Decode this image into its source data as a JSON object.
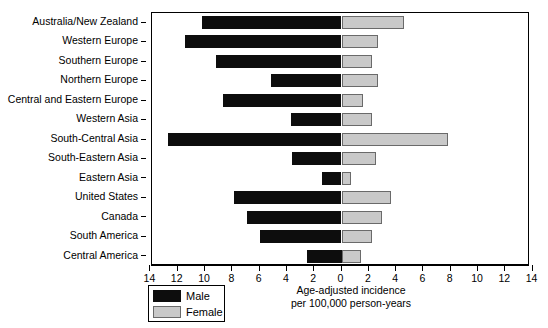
{
  "chart_data": {
    "type": "bar",
    "orientation": "horizontal-diverging",
    "title": "",
    "xlabel": "Age-adjusted incidence\nper 100,000 person-years",
    "xlabel_line1": "Age-adjusted incidence",
    "xlabel_line2": "per 100,000 person-years",
    "ylabel": "",
    "grid": false,
    "legend_position": "bottom-left",
    "xlim": [
      -14,
      14
    ],
    "xticks": [
      -14,
      -12,
      -10,
      -8,
      -6,
      -4,
      -2,
      0,
      2,
      4,
      6,
      8,
      10,
      12,
      14
    ],
    "xticklabels": [
      "14",
      "12",
      "10",
      "8",
      "6",
      "4",
      "2",
      "0",
      "2",
      "4",
      "6",
      "8",
      "10",
      "12",
      "14"
    ],
    "categories": [
      "Australia/New Zealand",
      "Western Europe",
      "Southern Europe",
      "Northern Europe",
      "Central and Eastern Europe",
      "Western Asia",
      "South-Central Asia",
      "South-Eastern Asia",
      "Eastern Asia",
      "United States",
      "Canada",
      "South America",
      "Central America"
    ],
    "series": [
      {
        "name": "Male",
        "color": "#0d0d0d",
        "direction": "left",
        "values": [
          10.2,
          11.5,
          9.2,
          5.2,
          8.7,
          3.7,
          12.7,
          3.6,
          1.4,
          7.9,
          6.9,
          6.0,
          2.5
        ]
      },
      {
        "name": "Female",
        "color": "#c9c9c9",
        "direction": "right",
        "values": [
          4.6,
          2.7,
          2.2,
          2.7,
          1.6,
          2.2,
          7.8,
          2.5,
          0.7,
          3.6,
          3.0,
          2.2,
          1.4
        ]
      }
    ]
  },
  "legend": {
    "items": [
      {
        "label": "Male",
        "swatch": "male"
      },
      {
        "label": "Female",
        "swatch": "female"
      }
    ]
  }
}
